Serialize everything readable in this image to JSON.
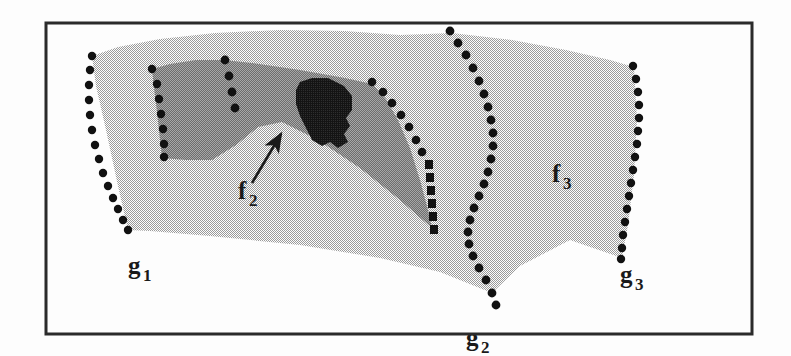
{
  "figure": {
    "background_color": "#fdfdfd",
    "frame": {
      "name": "figure-border",
      "stroke_color": "#2b2b2b",
      "stroke_width": 3,
      "x": 46,
      "y": 23,
      "width": 706,
      "height": 311
    },
    "colors": {
      "light_gray_fill": "#c9c9c9",
      "mid_gray_fill": "#8c8c8c",
      "dark_fill": "#1f1f1f",
      "dot_color": "#111111",
      "line_color": "#1a1a1a",
      "paper_white": "#fdfdfd"
    },
    "labels": [
      {
        "id": "g1",
        "base": "g",
        "subscript": "1",
        "x": 128,
        "y": 274
      },
      {
        "id": "g2",
        "base": "g",
        "subscript": "2",
        "x": 479,
        "y": 346
      },
      {
        "id": "g3",
        "base": "g",
        "subscript": "3",
        "x": 620,
        "y": 283
      },
      {
        "id": "f2",
        "base": "f",
        "subscript": "2",
        "x": 238,
        "y": 199
      },
      {
        "id": "f3",
        "base": "f",
        "subscript": "3",
        "x": 552,
        "y": 182
      }
    ],
    "annotation_arrow": {
      "name": "f2-pointer-arrow",
      "from_x": 252,
      "from_y": 183,
      "to_x": 283,
      "to_y": 132
    },
    "regions": [
      {
        "id": "light-region",
        "name": "light-shaded-body",
        "fill": "#c9c9c9",
        "description": "Large light-gray shaded body occupying most of the frame"
      },
      {
        "id": "mid-region",
        "name": "mid-shaded-face-f2",
        "fill": "#8c8c8c",
        "description": "Mid-gray notched face labelled f2"
      },
      {
        "id": "dark-region",
        "name": "dark-inner-patch",
        "fill": "#1f1f1f",
        "description": "Small solid dark irregular patch inside the mid-gray face"
      }
    ],
    "dotted_curves": [
      {
        "id": "left-curve",
        "name": "dotted-silhouette-left-g1",
        "dot_count": 16
      },
      {
        "id": "middle-curve",
        "name": "dotted-silhouette-middle-g2",
        "dot_count": 23
      },
      {
        "id": "right-curve",
        "name": "dotted-silhouette-right-g3",
        "dot_count": 17
      },
      {
        "id": "mid-face-left-curve",
        "name": "dotted-edge-mid-face-left",
        "dot_count": 8
      },
      {
        "id": "mid-face-inner-curve",
        "name": "dotted-edge-mid-face-inner",
        "dot_count": 4
      },
      {
        "id": "mid-face-right-curve",
        "name": "dotted-edge-mid-face-right",
        "dot_count": 15
      }
    ]
  }
}
